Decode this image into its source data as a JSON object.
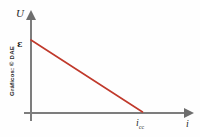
{
  "chart_data": {
    "type": "line",
    "title": "",
    "xlabel": "i",
    "ylabel": "U",
    "x": [
      0,
      1
    ],
    "values": [
      1,
      0
    ],
    "series": [
      {
        "name": "U = ε - r·i",
        "values": [
          1,
          0
        ],
        "color": "#c0392b"
      }
    ],
    "annotations": [
      {
        "name": "y-intercept",
        "label": "ε",
        "axis": "y",
        "value": 1
      },
      {
        "name": "x-intercept",
        "label": "i",
        "sublabel": "cc",
        "axis": "x",
        "value": 1
      }
    ],
    "xlim": [
      0,
      1.3
    ],
    "ylim": [
      0,
      1.25
    ],
    "grid": false,
    "legend": false
  },
  "labels": {
    "y_axis": "U",
    "x_axis": "i",
    "emf": "ε",
    "short_circuit_current": "i",
    "short_circuit_subscript": "cc"
  },
  "credit": {
    "text": "Gráficos: © DAE"
  },
  "colors": {
    "curve": "#c0392b",
    "axis": "#7d7d7d",
    "text": "#262626",
    "background": "#fefefe"
  }
}
